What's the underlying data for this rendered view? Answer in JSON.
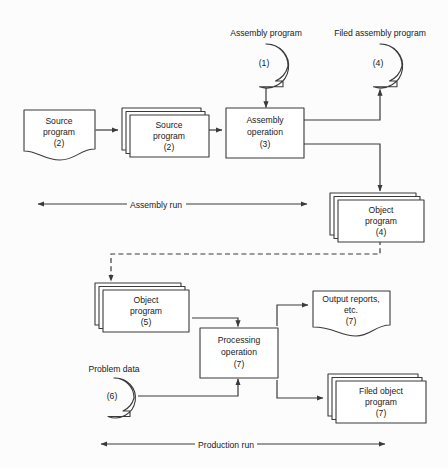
{
  "diagram": {
    "background_color": "#fcfcfc",
    "line_color": "#3a3a3a",
    "shape_fill": "#ffffff"
  },
  "nodes": {
    "source_program_document": {
      "name": "source-program-document",
      "shape": "document",
      "line1": "Source",
      "line2": "program",
      "line3": "(2)"
    },
    "source_program_deck": {
      "name": "source-program-deck",
      "shape": "card-deck",
      "line1": "Source",
      "line2": "program",
      "line3": "(2)"
    },
    "assembly_operation": {
      "name": "assembly-operation-process",
      "shape": "process",
      "line1": "Assembly",
      "line2": "operation",
      "line3": "(3)"
    },
    "assembly_program_tape": {
      "name": "assembly-program-tape",
      "shape": "magnetic-tape",
      "caption": "Assembly program",
      "value": "(1)"
    },
    "filed_assembly_program_tape": {
      "name": "filed-assembly-program-tape",
      "shape": "magnetic-tape",
      "caption": "Filed assembly program",
      "value": "(4)"
    },
    "object_program_deck_4": {
      "name": "object-program-deck-4",
      "shape": "card-deck",
      "line1": "Object",
      "line2": "program",
      "line3": "(4)"
    },
    "object_program_deck_5": {
      "name": "object-program-deck-5",
      "shape": "card-deck",
      "line1": "Object",
      "line2": "program",
      "line3": "(5)"
    },
    "processing_operation": {
      "name": "processing-operation-process",
      "shape": "process",
      "line1": "Processing",
      "line2": "operation",
      "line3": "(7)"
    },
    "output_reports_document": {
      "name": "output-reports-document",
      "shape": "document",
      "line1": "Output reports,",
      "line2": "etc.",
      "line3": "(7)"
    },
    "problem_data_tape": {
      "name": "problem-data-tape",
      "shape": "magnetic-tape",
      "caption": "Problem data",
      "value": "(6)"
    },
    "filed_object_program_deck": {
      "name": "filed-object-program-deck",
      "shape": "card-deck",
      "line1": "Filed object",
      "line2": "program",
      "line3": "(7)"
    }
  },
  "span_labels": {
    "assembly_run": "Assembly run",
    "production_run": "Production run"
  }
}
